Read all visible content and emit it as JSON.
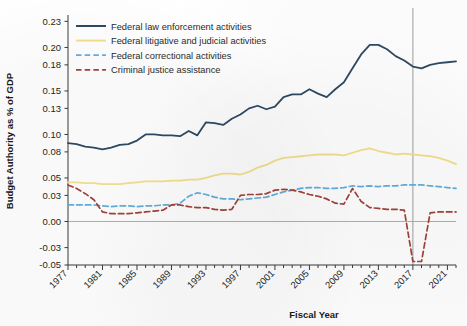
{
  "chart_data": {
    "type": "line",
    "title": "",
    "xlabel": "Fiscal Year",
    "ylabel": "Budget Authority as % of GDP",
    "xlim": [
      1977,
      2022
    ],
    "ylim": [
      -0.05,
      0.235
    ],
    "grid": false,
    "legend_position": "top-left",
    "y_ticks": [
      "0.23",
      "0.20",
      "0.18",
      "0.15",
      "0.13",
      "0.10",
      "0.08",
      "0.05",
      "0.03",
      "0.00",
      "-0.03",
      "-0.05"
    ],
    "y_tick_values": [
      0.23,
      0.2,
      0.18,
      0.15,
      0.13,
      0.1,
      0.08,
      0.05,
      0.03,
      0.0,
      -0.03,
      -0.05
    ],
    "x_ticks": [
      "1977",
      "1981",
      "1985",
      "1989",
      "1993",
      "1997",
      "2001",
      "2005",
      "2009",
      "2013",
      "2017",
      "2021"
    ],
    "x_tick_values": [
      1977,
      1981,
      1985,
      1989,
      1993,
      1997,
      2001,
      2005,
      2009,
      2013,
      2017,
      2021
    ],
    "x": [
      1977,
      1978,
      1979,
      1980,
      1981,
      1982,
      1983,
      1984,
      1985,
      1986,
      1987,
      1988,
      1989,
      1990,
      1991,
      1992,
      1993,
      1994,
      1995,
      1996,
      1997,
      1998,
      1999,
      2000,
      2001,
      2002,
      2003,
      2004,
      2005,
      2006,
      2007,
      2008,
      2009,
      2010,
      2011,
      2012,
      2013,
      2014,
      2015,
      2016,
      2017,
      2018,
      2019,
      2020,
      2021,
      2022
    ],
    "annotations": [
      {
        "type": "vline",
        "x": 2017,
        "label": ""
      },
      {
        "type": "hline",
        "y": 0.0,
        "label": ""
      }
    ],
    "series": [
      {
        "name": "Federal law enforcement activities",
        "color": "#2e4a63",
        "style": "solid",
        "values": [
          0.09,
          0.089,
          0.086,
          0.085,
          0.083,
          0.085,
          0.088,
          0.089,
          0.093,
          0.1,
          0.1,
          0.099,
          0.099,
          0.098,
          0.104,
          0.099,
          0.114,
          0.113,
          0.111,
          0.118,
          0.123,
          0.13,
          0.133,
          0.129,
          0.132,
          0.143,
          0.146,
          0.146,
          0.152,
          0.147,
          0.143,
          0.152,
          0.16,
          0.176,
          0.192,
          0.203,
          0.203,
          0.198,
          0.19,
          0.185,
          0.178,
          0.176,
          0.18,
          0.182,
          0.183,
          0.184
        ]
      },
      {
        "name": "Federal litigative and judicial activities",
        "color": "#f5e08c",
        "style": "solid",
        "values": [
          0.045,
          0.045,
          0.044,
          0.044,
          0.043,
          0.043,
          0.043,
          0.044,
          0.045,
          0.046,
          0.046,
          0.046,
          0.047,
          0.047,
          0.048,
          0.048,
          0.05,
          0.053,
          0.055,
          0.055,
          0.054,
          0.057,
          0.062,
          0.065,
          0.07,
          0.073,
          0.074,
          0.075,
          0.076,
          0.077,
          0.077,
          0.077,
          0.076,
          0.079,
          0.082,
          0.084,
          0.081,
          0.079,
          0.077,
          0.078,
          0.077,
          0.076,
          0.075,
          0.073,
          0.07,
          0.066
        ]
      },
      {
        "name": "Federal correctional activities",
        "color": "#63aede",
        "style": "dashed",
        "values": [
          0.019,
          0.019,
          0.019,
          0.019,
          0.018,
          0.017,
          0.018,
          0.018,
          0.017,
          0.018,
          0.018,
          0.019,
          0.019,
          0.021,
          0.029,
          0.033,
          0.031,
          0.028,
          0.026,
          0.026,
          0.025,
          0.026,
          0.027,
          0.028,
          0.031,
          0.034,
          0.036,
          0.038,
          0.039,
          0.039,
          0.038,
          0.038,
          0.039,
          0.041,
          0.04,
          0.041,
          0.04,
          0.041,
          0.041,
          0.042,
          0.042,
          0.042,
          0.041,
          0.04,
          0.039,
          0.038
        ]
      },
      {
        "name": "Criminal justice assistance",
        "color": "#a3423c",
        "style": "dashed",
        "values": [
          0.042,
          0.038,
          0.032,
          0.025,
          0.011,
          0.009,
          0.009,
          0.009,
          0.01,
          0.011,
          0.012,
          0.013,
          0.019,
          0.019,
          0.017,
          0.016,
          0.016,
          0.014,
          0.013,
          0.014,
          0.03,
          0.031,
          0.031,
          0.032,
          0.036,
          0.037,
          0.036,
          0.034,
          0.031,
          0.029,
          0.026,
          0.021,
          0.02,
          0.038,
          0.023,
          0.016,
          0.015,
          0.014,
          0.014,
          0.013,
          -0.046,
          -0.046,
          0.01,
          0.011,
          0.011,
          0.011
        ]
      }
    ]
  },
  "axis_titles": {
    "x": "Fiscal Year",
    "y": "Budget Authority as % of GDP"
  },
  "legend": {
    "items": [
      {
        "label": "Federal law enforcement activities",
        "color": "#2e4a63",
        "style": "solid"
      },
      {
        "label": "Federal litigative and judicial activities",
        "color": "#f5e08c",
        "style": "solid"
      },
      {
        "label": "Federal correctional activities",
        "color": "#63aede",
        "style": "dashed"
      },
      {
        "label": "Criminal justice assistance",
        "color": "#a3423c",
        "style": "dashed"
      }
    ]
  }
}
